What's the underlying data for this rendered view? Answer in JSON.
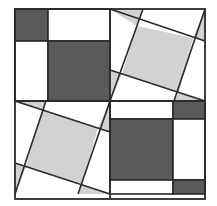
{
  "colors": {
    "background": "#ffffff",
    "dark": "#5a5a5a",
    "light": "#d2d2d2",
    "stroke": "#2a2a2a",
    "white": "#ffffff"
  },
  "outer_square": {
    "x": 15,
    "y": 9,
    "size": 190
  },
  "quadrants": [
    {
      "name": "top-left",
      "type": "axis-aligned",
      "shapes": [
        {
          "kind": "rect",
          "fill": "dark",
          "x": 15,
          "y": 9,
          "w": 33,
          "h": 32
        },
        {
          "kind": "rect",
          "fill": "white",
          "x": 48,
          "y": 9,
          "w": 62,
          "h": 32
        },
        {
          "kind": "rect",
          "fill": "white",
          "x": 15,
          "y": 41,
          "w": 33,
          "h": 60
        },
        {
          "kind": "rect",
          "fill": "dark",
          "x": 48,
          "y": 41,
          "w": 62,
          "h": 60
        }
      ]
    },
    {
      "name": "top-right",
      "type": "rotated",
      "inner_square": [
        [
          103,
          31
        ],
        [
          174,
          68
        ],
        [
          154,
          120
        ],
        [
          122,
          85
        ]
      ],
      "shapes": [
        {
          "kind": "poly",
          "fill": "light",
          "points": [
            [
              110,
              9
            ],
            [
              143,
              9
            ],
            [
              137,
              26
            ]
          ]
        },
        {
          "kind": "poly",
          "fill": "light",
          "points": [
            [
              205,
              9
            ],
            [
              205,
              41
            ],
            [
              193,
              38
            ]
          ]
        },
        {
          "kind": "poly",
          "fill": "light",
          "points": [
            [
              205,
              101
            ],
            [
              174,
              101
            ],
            [
              179,
              92
            ]
          ]
        },
        {
          "kind": "poly",
          "fill": "light",
          "points": [
            [
              110,
              101
            ],
            [
              110,
              70
            ],
            [
              122,
              74
            ]
          ]
        },
        {
          "kind": "poly",
          "fill": "light",
          "points": [
            [
              137,
              26
            ],
            [
              193,
              38
            ],
            [
              179,
              92
            ],
            [
              122,
              74
            ]
          ]
        }
      ]
    },
    {
      "name": "bottom-left",
      "type": "rotated",
      "shapes": [
        {
          "kind": "poly",
          "fill": "light",
          "points": [
            [
              15,
              101
            ],
            [
              46,
              101
            ],
            [
              42,
              110
            ]
          ]
        },
        {
          "kind": "poly",
          "fill": "light",
          "points": [
            [
              110,
              101
            ],
            [
              110,
              132
            ],
            [
              98,
              128
            ]
          ]
        },
        {
          "kind": "poly",
          "fill": "light",
          "points": [
            [
              110,
              194
            ],
            [
              78,
              194
            ],
            [
              82,
              184
            ]
          ]
        },
        {
          "kind": "poly",
          "fill": "light",
          "points": [
            [
              15,
              194
            ],
            [
              15,
              163
            ],
            [
              26,
              167
            ]
          ]
        },
        {
          "kind": "poly",
          "fill": "light",
          "points": [
            [
              42,
              110
            ],
            [
              98,
              128
            ],
            [
              82,
              184
            ],
            [
              26,
              167
            ]
          ]
        }
      ]
    },
    {
      "name": "bottom-right",
      "type": "axis-aligned",
      "shapes": [
        {
          "kind": "rect",
          "fill": "white",
          "x": 110,
          "y": 101,
          "w": 63,
          "h": 18
        },
        {
          "kind": "rect",
          "fill": "dark",
          "x": 173,
          "y": 101,
          "w": 32,
          "h": 18
        },
        {
          "kind": "rect",
          "fill": "dark",
          "x": 110,
          "y": 119,
          "w": 63,
          "h": 61
        },
        {
          "kind": "rect",
          "fill": "white",
          "x": 173,
          "y": 119,
          "w": 32,
          "h": 61
        },
        {
          "kind": "rect",
          "fill": "white",
          "x": 110,
          "y": 180,
          "w": 63,
          "h": 14
        },
        {
          "kind": "rect",
          "fill": "dark",
          "x": 173,
          "y": 180,
          "w": 32,
          "h": 14
        }
      ]
    }
  ],
  "lines": [
    {
      "quadrant": "top-right",
      "from": [
        110,
        9
      ],
      "to": [
        205,
        41
      ]
    },
    {
      "quadrant": "top-right",
      "from": [
        143,
        9
      ],
      "to": [
        110,
        101
      ]
    },
    {
      "quadrant": "top-right",
      "from": [
        110,
        70
      ],
      "to": [
        205,
        101
      ]
    },
    {
      "quadrant": "top-right",
      "from": [
        205,
        9
      ],
      "to": [
        174,
        101
      ]
    },
    {
      "quadrant": "bottom-left",
      "from": [
        15,
        101
      ],
      "to": [
        110,
        132
      ]
    },
    {
      "quadrant": "bottom-left",
      "from": [
        46,
        101
      ],
      "to": [
        15,
        194
      ]
    },
    {
      "quadrant": "bottom-left",
      "from": [
        15,
        163
      ],
      "to": [
        110,
        194
      ]
    },
    {
      "quadrant": "bottom-left",
      "from": [
        110,
        101
      ],
      "to": [
        78,
        194
      ]
    }
  ]
}
